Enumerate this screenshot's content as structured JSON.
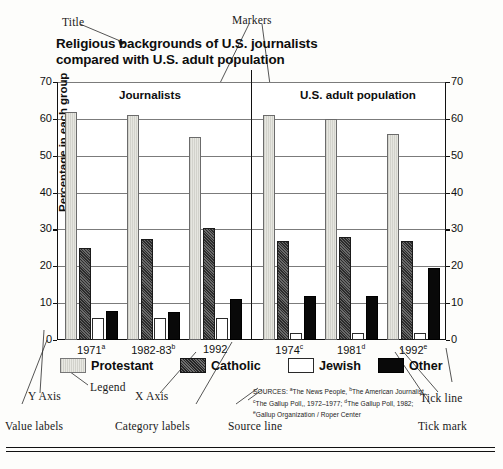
{
  "annotations": {
    "title": "Title",
    "markers": "Markers",
    "y_axis": "Y Axis",
    "x_axis": "X Axis",
    "legend": "Legend",
    "value_labels": "Value labels",
    "category_labels": "Category labels",
    "source_line": "Source line",
    "tick_line": "Tick line",
    "tick_mark": "Tick mark"
  },
  "group_headers": {
    "left": "Journalists",
    "right": "U.S. adult population"
  },
  "legend": [
    {
      "label": "Protestant",
      "key": "protestant",
      "color": "#dcdcd6"
    },
    {
      "label": "Catholic",
      "key": "catholic",
      "color": "#4a4a4a"
    },
    {
      "label": "Jewish",
      "key": "jewish",
      "color": "#ffffff"
    },
    {
      "label": "Other",
      "key": "other",
      "color": "#090909"
    }
  ],
  "sources": {
    "line1_prefix": "SOURCES:",
    "line1": "The News People,",
    "line1b": "The American Journalist,",
    "line2": "The Gallup Poll,, 1972–1977;",
    "line2b": "The Gallup Poll, 1982;",
    "line3": "Gallup Organization / Roper Center",
    "marks": {
      "a": "a",
      "b": "b",
      "c": "c",
      "d": "d",
      "e": "e"
    }
  },
  "chart_data": {
    "type": "bar",
    "title": "Religious backgrounds of U.S. journalists compared with U.S. adult population",
    "title_line1": "Religious backgrounds of U.S. journalists",
    "title_line2": "compared with U.S. adult population",
    "xlabel": "",
    "ylabel": "Percentage in each group",
    "ylim": [
      0,
      70
    ],
    "yticks": [
      0,
      10,
      20,
      30,
      40,
      50,
      60,
      70
    ],
    "ytick_labels": [
      "0",
      "10",
      "20",
      "30",
      "40",
      "50",
      "60",
      "70"
    ],
    "grid": true,
    "legend_position": "below",
    "dual_y_axis": true,
    "groups": [
      "Journalists",
      "U.S. adult population"
    ],
    "categories": [
      "1971a",
      "1982-83b",
      "1992",
      "1974c",
      "1981d",
      "1992e"
    ],
    "category_labels": [
      {
        "text": "1971",
        "sup": "a"
      },
      {
        "text": "1982-83",
        "sup": "b"
      },
      {
        "text": "1992",
        "sup": ""
      },
      {
        "text": "1974",
        "sup": "c"
      },
      {
        "text": "1981",
        "sup": "d"
      },
      {
        "text": "1992",
        "sup": "e"
      }
    ],
    "series": [
      {
        "name": "Protestant",
        "values": [
          62,
          61,
          55,
          61,
          60,
          56
        ]
      },
      {
        "name": "Catholic",
        "values": [
          25,
          27.5,
          30.5,
          27,
          28,
          27
        ]
      },
      {
        "name": "Jewish",
        "values": [
          6,
          6,
          6,
          2,
          2,
          2
        ]
      },
      {
        "name": "Other",
        "values": [
          8,
          7.5,
          11,
          12,
          12,
          19.5
        ]
      }
    ]
  }
}
